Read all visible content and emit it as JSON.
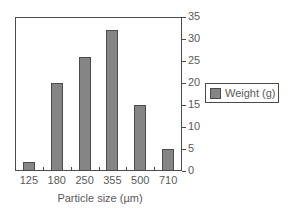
{
  "chart_data": {
    "type": "bar",
    "title": "",
    "xlabel": "Particle size (µm)",
    "ylabel": "",
    "categories": [
      "125",
      "180",
      "250",
      "355",
      "500",
      "710"
    ],
    "series": [
      {
        "name": "Weight (g)",
        "values": [
          2,
          20,
          26,
          32,
          15,
          5
        ]
      }
    ],
    "y_ticks": [
      "0",
      "5",
      "10",
      "15",
      "20",
      "25",
      "30",
      "35"
    ],
    "ylim": [
      0,
      35
    ],
    "y_axis_position": "right",
    "grid": false,
    "legend_position": "right",
    "colors": {
      "bar": "#858585",
      "axis": "#4a4a4a"
    }
  },
  "legend": {
    "label": "Weight (g)"
  },
  "axis": {
    "xtitle": "Particle size (µm)"
  }
}
